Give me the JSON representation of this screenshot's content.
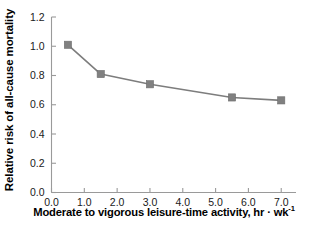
{
  "chart_data": {
    "type": "line",
    "title": "",
    "subtitle": "",
    "xlabel": "Moderate to vigorous leisure-time activity, hr · wk",
    "xlabel_superscript": "-1",
    "ylabel": "Relative risk of all-cause mortality",
    "x": [
      0.5,
      1.5,
      3.0,
      5.5,
      7.0
    ],
    "values": [
      1.01,
      0.81,
      0.74,
      0.65,
      0.63
    ],
    "series": [
      {
        "name": "Relative risk of all-cause mortality",
        "values": [
          1.01,
          0.81,
          0.74,
          0.65,
          0.63
        ]
      }
    ],
    "xlim": [
      0.0,
      7.45
    ],
    "ylim": [
      0.0,
      1.2
    ],
    "xticks": [
      "0.0",
      "1.0",
      "2.0",
      "3.0",
      "4.0",
      "5.0",
      "6.0",
      "7.0"
    ],
    "xtick_values": [
      0.0,
      1.0,
      2.0,
      3.0,
      4.0,
      5.0,
      6.0,
      7.0
    ],
    "yticks": [
      "0.0",
      "0.2",
      "0.4",
      "0.6",
      "0.8",
      "1.0",
      "1.2"
    ],
    "ytick_values": [
      0.0,
      0.2,
      0.4,
      0.6,
      0.8,
      1.0,
      1.2
    ],
    "grid": false,
    "legend": false,
    "legend_position": "none",
    "marker": "square",
    "marker_color": "#808080",
    "line_color": "#7d7d7d",
    "axis_color": "#9a9a9a",
    "background_color": "#ffffff",
    "annotations": []
  },
  "axis": {
    "ylabel": "Relative risk of all-cause mortality",
    "xlabel_main": "Moderate to vigorous leisure-time activity, hr · wk",
    "xlabel_exponent": "-1"
  },
  "ytick_labels": [
    {
      "label": "1.2",
      "value": 1.2
    },
    {
      "label": "1.0",
      "value": 1.0
    },
    {
      "label": "0.8",
      "value": 0.8
    },
    {
      "label": "0.6",
      "value": 0.6
    },
    {
      "label": "0.4",
      "value": 0.4
    },
    {
      "label": "0.2",
      "value": 0.2
    },
    {
      "label": "0.0",
      "value": 0.0
    }
  ],
  "xtick_labels": [
    {
      "label": "0.0",
      "value": 0.0
    },
    {
      "label": "1.0",
      "value": 1.0
    },
    {
      "label": "2.0",
      "value": 2.0
    },
    {
      "label": "3.0",
      "value": 3.0
    },
    {
      "label": "4.0",
      "value": 4.0
    },
    {
      "label": "5.0",
      "value": 5.0
    },
    {
      "label": "6.0",
      "value": 6.0
    },
    {
      "label": "7.0",
      "value": 7.0
    }
  ]
}
